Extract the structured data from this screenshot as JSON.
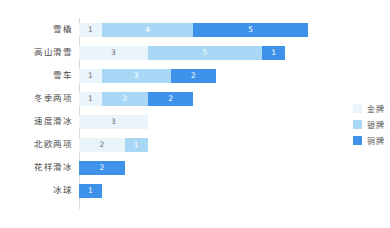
{
  "chart_data": {
    "type": "bar",
    "orientation": "horizontal",
    "stacked": true,
    "title": "",
    "xlabel": "",
    "ylabel": "",
    "xlim": [
      0,
      10
    ],
    "grid": false,
    "legend_position": "right",
    "categories": [
      "雪橇",
      "高山滑雪",
      "雪车",
      "冬季两项",
      "速度滑冰",
      "北欧两项",
      "花样滑冰",
      "冰球"
    ],
    "series": [
      {
        "name": "金牌",
        "color": "#eaf4fb",
        "values": [
          1,
          3,
          1,
          1,
          3,
          2,
          0,
          0
        ]
      },
      {
        "name": "银牌",
        "color": "#a8d8f5",
        "values": [
          4,
          5,
          3,
          2,
          0,
          1,
          0,
          0
        ]
      },
      {
        "name": "铜牌",
        "color": "#3f92ea",
        "values": [
          5,
          1,
          2,
          2,
          0,
          0,
          2,
          1
        ]
      }
    ],
    "totals": [
      10,
      9,
      6,
      5,
      3,
      3,
      2,
      1
    ]
  },
  "legend": {
    "items": [
      {
        "label": "金牌",
        "color": "#eaf4fb"
      },
      {
        "label": "银牌",
        "color": "#a8d8f5"
      },
      {
        "label": "铜牌",
        "color": "#3f92ea"
      }
    ]
  },
  "rows": [
    {
      "label": "雪橇",
      "gold": "1",
      "silver": "4",
      "bronze": "5"
    },
    {
      "label": "高山滑雪",
      "gold": "3",
      "silver": "5",
      "bronze": "1"
    },
    {
      "label": "雪车",
      "gold": "1",
      "silver": "3",
      "bronze": "2"
    },
    {
      "label": "冬季两项",
      "gold": "1",
      "silver": "2",
      "bronze": "2"
    },
    {
      "label": "速度滑冰",
      "gold": "3",
      "silver": "",
      "bronze": ""
    },
    {
      "label": "北欧两项",
      "gold": "2",
      "silver": "1",
      "bronze": ""
    },
    {
      "label": "花样滑冰",
      "gold": "",
      "silver": "",
      "bronze": "2"
    },
    {
      "label": "冰球",
      "gold": "",
      "silver": "",
      "bronze": "1"
    }
  ]
}
